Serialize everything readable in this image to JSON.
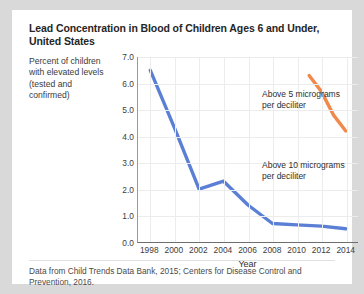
{
  "card": {
    "title": "Lead Concentration in Blood of Children Ages 6 and Under, United States",
    "y_axis_caption": "Percent of children with elevated levels (tested and confirmed)",
    "source_note": "Data from Child Trends Data Bank, 2015; Centers for Disease Control and Prevention, 2016."
  },
  "colors": {
    "series_blue": "#5b7fd4",
    "series_orange": "#ef8a4c",
    "grid": "#ececec",
    "axis": "#6e6e6e",
    "card_background": "#ffffff",
    "page_background": "#d9d9d9"
  },
  "chart_data": {
    "type": "line",
    "title": "Lead Concentration in Blood of Children Ages 6 and Under, United States",
    "xlabel": "Year",
    "ylabel": "Percent of children with elevated levels (tested and confirmed)",
    "xlim": [
      1997,
      2015
    ],
    "ylim": [
      0.0,
      7.0
    ],
    "grid": true,
    "legend": "none",
    "xticks": [
      1998,
      2000,
      2002,
      2004,
      2006,
      2008,
      2010,
      2012,
      2014
    ],
    "yticks": [
      "0.0",
      "1.0",
      "2.0",
      "3.0",
      "4.0",
      "5.0",
      "6.0",
      "7.0"
    ],
    "annotations": [
      {
        "text_line1": "Above 5 micrograms",
        "text_line2": "per deciliter"
      },
      {
        "text_line1": "Above 10 micrograms",
        "text_line2": "per deciliter"
      }
    ],
    "series": [
      {
        "name": "Above 10 micrograms per deciliter",
        "color": "#5b7fd4",
        "x": [
          1998,
          2000,
          2002,
          2004,
          2006,
          2008,
          2010,
          2012,
          2014
        ],
        "values": [
          6.5,
          4.3,
          2.0,
          2.3,
          1.4,
          0.7,
          0.65,
          0.6,
          0.5
        ]
      },
      {
        "name": "Above 5 micrograms per deciliter",
        "color": "#ef8a4c",
        "x": [
          2011,
          2012,
          2013,
          2014
        ],
        "values": [
          6.3,
          5.7,
          4.8,
          4.2
        ]
      }
    ]
  }
}
